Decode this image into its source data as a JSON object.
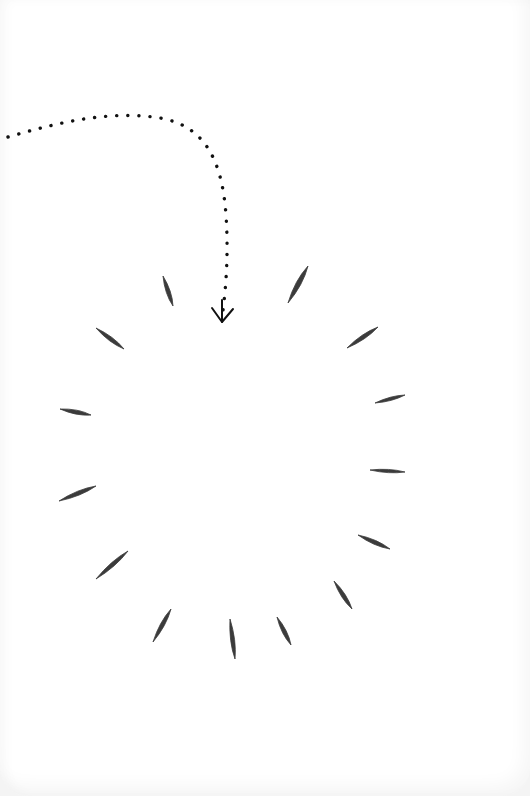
{
  "illustration": {
    "description": "Hand-drawn dotted curved arrow pointing down into a ring of brush-stroke marks",
    "colors": {
      "background": "#ffffff",
      "ink": "#2b2b2b",
      "dots": "#111111"
    },
    "arrow": {
      "path": "M 8 137 C 60 122, 110 110, 160 118 C 205 126, 222 160, 226 215 C 229 260, 225 295, 222 318",
      "tip": [
        222,
        322
      ],
      "head_left": [
        212,
        308
      ],
      "head_right": [
        233,
        309
      ]
    },
    "strokes": [
      {
        "x1": 163,
        "y1": 276,
        "x2": 173,
        "y2": 306,
        "w": 5
      },
      {
        "x1": 96,
        "y1": 328,
        "x2": 124,
        "y2": 349,
        "w": 5
      },
      {
        "x1": 60,
        "y1": 409,
        "x2": 91,
        "y2": 415,
        "w": 5
      },
      {
        "x1": 59,
        "y1": 501,
        "x2": 96,
        "y2": 486,
        "w": 5
      },
      {
        "x1": 96,
        "y1": 579,
        "x2": 128,
        "y2": 551,
        "w": 5
      },
      {
        "x1": 153,
        "y1": 642,
        "x2": 171,
        "y2": 609,
        "w": 5
      },
      {
        "x1": 230,
        "y1": 619,
        "x2": 235,
        "y2": 659,
        "w": 5
      },
      {
        "x1": 277,
        "y1": 617,
        "x2": 291,
        "y2": 645,
        "w": 5
      },
      {
        "x1": 334,
        "y1": 581,
        "x2": 352,
        "y2": 609,
        "w": 5
      },
      {
        "x1": 358,
        "y1": 535,
        "x2": 390,
        "y2": 549,
        "w": 5
      },
      {
        "x1": 370,
        "y1": 470,
        "x2": 405,
        "y2": 472,
        "w": 4
      },
      {
        "x1": 375,
        "y1": 403,
        "x2": 405,
        "y2": 395,
        "w": 4
      },
      {
        "x1": 347,
        "y1": 348,
        "x2": 378,
        "y2": 327,
        "w": 5
      },
      {
        "x1": 288,
        "y1": 303,
        "x2": 308,
        "y2": 266,
        "w": 6
      }
    ]
  }
}
